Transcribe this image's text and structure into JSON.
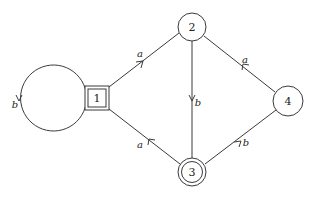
{
  "diagram": {
    "type": "finite-automaton",
    "nodes": [
      {
        "id": "1",
        "label": "1",
        "shape": "double-square",
        "role": "initial-state"
      },
      {
        "id": "2",
        "label": "2",
        "shape": "circle"
      },
      {
        "id": "3",
        "label": "3",
        "shape": "double-circle",
        "role": "accepting-state"
      },
      {
        "id": "4",
        "label": "4",
        "shape": "circle"
      }
    ],
    "edges": [
      {
        "from": "1",
        "to": "1",
        "label": "b"
      },
      {
        "from": "1",
        "to": "2",
        "label": "a"
      },
      {
        "from": "2",
        "to": "3",
        "label": "b"
      },
      {
        "from": "4",
        "to": "2",
        "label": "a"
      },
      {
        "from": "3",
        "to": "1",
        "label": "a"
      },
      {
        "from": "3",
        "to": "4",
        "label": "b"
      }
    ]
  },
  "colors": {
    "stroke": "#3a3a3a",
    "text": "#222222",
    "background": "#ffffff"
  }
}
